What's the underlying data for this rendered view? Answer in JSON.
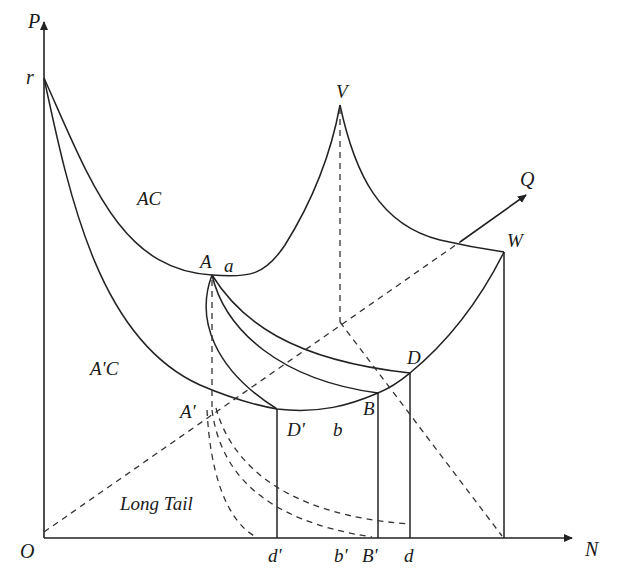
{
  "diagram": {
    "type": "economics-cost-curves",
    "axes": {
      "vertical_label": "P",
      "horizontal_label": "N",
      "origin_label": "O",
      "vertical_intercept_label": "r",
      "diagonal_axis_label": "Q"
    },
    "curve_labels": {
      "ac": "AC",
      "a_prime_c": "A'C",
      "long_tail": "Long Tail"
    },
    "points": {
      "A": "A",
      "a": "a",
      "V": "V",
      "W": "W",
      "D": "D",
      "B": "B",
      "D_prime": "D'",
      "b": "b",
      "A_prime": "A'"
    },
    "n_axis_ticks": [
      "d'",
      "b'",
      "B'",
      "d"
    ]
  }
}
